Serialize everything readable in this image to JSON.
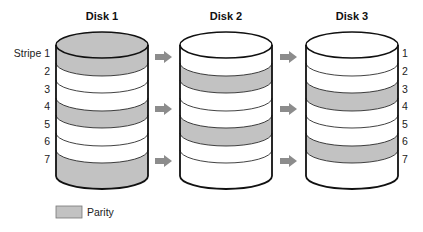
{
  "diagram": {
    "disks": [
      {
        "title": "Disk 1",
        "x": 56,
        "parity_stripes": [
          1,
          4,
          7
        ]
      },
      {
        "title": "Disk 2",
        "x": 180,
        "parity_stripes": [
          2,
          5
        ]
      },
      {
        "title": "Disk 3",
        "x": 306,
        "parity_stripes": [
          3,
          6
        ]
      }
    ],
    "stripe_labels_left": [
      "Stripe 1",
      "2",
      "3",
      "4",
      "5",
      "6",
      "7"
    ],
    "stripe_labels_right": [
      "1",
      "2",
      "3",
      "4",
      "5",
      "6",
      "7"
    ],
    "legend": {
      "label": "Parity"
    },
    "colors": {
      "parity": "#c2c2c2",
      "data": "#ffffff",
      "outline": "#111111",
      "arrow": "#8c8c8c"
    }
  }
}
